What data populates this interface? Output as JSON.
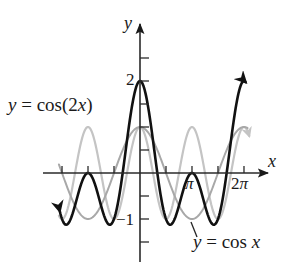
{
  "chart_data": {
    "type": "line",
    "title": "",
    "xlabel": "x",
    "ylabel": "y",
    "xlim": [
      -5.1,
      7.5
    ],
    "ylim": [
      -1.7,
      3.0
    ],
    "grid": false,
    "x_ticks": [
      {
        "value": -4.712,
        "label": ""
      },
      {
        "value": -3.1416,
        "label": ""
      },
      {
        "value": -1.5708,
        "label": ""
      },
      {
        "value": 1.5708,
        "label": ""
      },
      {
        "value": 3.1416,
        "label": "π"
      },
      {
        "value": 4.712,
        "label": ""
      },
      {
        "value": 6.2832,
        "label": "2π"
      }
    ],
    "y_ticks": [
      {
        "value": -1.5,
        "label": ""
      },
      {
        "value": -1,
        "label": "−1"
      },
      {
        "value": -0.5,
        "label": ""
      },
      {
        "value": 0.5,
        "label": ""
      },
      {
        "value": 1,
        "label": ""
      },
      {
        "value": 1.5,
        "label": ""
      },
      {
        "value": 2,
        "label": "2"
      },
      {
        "value": 2.5,
        "label": ""
      }
    ],
    "series": [
      {
        "name": "y = cos(2x)",
        "expr": "cos(2x)",
        "color": "#c4c4c4",
        "width": 2.2,
        "x_range": [
          -4.9,
          6.6
        ]
      },
      {
        "name": "y = cos x",
        "expr": "cos(x)",
        "color": "#a8a8a8",
        "width": 2.0,
        "x_range": [
          -4.9,
          6.5
        ]
      },
      {
        "name": "y = cos x + cos(2x)",
        "expr": "cos(x)+cos(2x)",
        "color": "#111111",
        "width": 2.6,
        "x_range": [
          -4.85,
          6.38
        ]
      }
    ],
    "annotations": [
      {
        "text": "y = cos(2x)",
        "position": "upper-left"
      },
      {
        "text": "y = cos x",
        "position": "lower-right",
        "pointer": true
      }
    ]
  },
  "labels": {
    "cos2x_y": "y",
    "cos2x_eq": " = cos(2",
    "cos2x_x": "x",
    "cos2x_close": ")",
    "cosx_y": "y",
    "cosx_eq": " = cos ",
    "cosx_x": "x",
    "axis_x": "x",
    "axis_y": "y",
    "tick_2": "2",
    "tick_neg1": "−1",
    "tick_pi": "π",
    "tick_2pi": "2π"
  },
  "layout": {
    "origin_px": [
      140,
      173
    ],
    "px_per_x": 16.55,
    "px_per_y": 46,
    "axis_color": "#2a2a2a"
  }
}
